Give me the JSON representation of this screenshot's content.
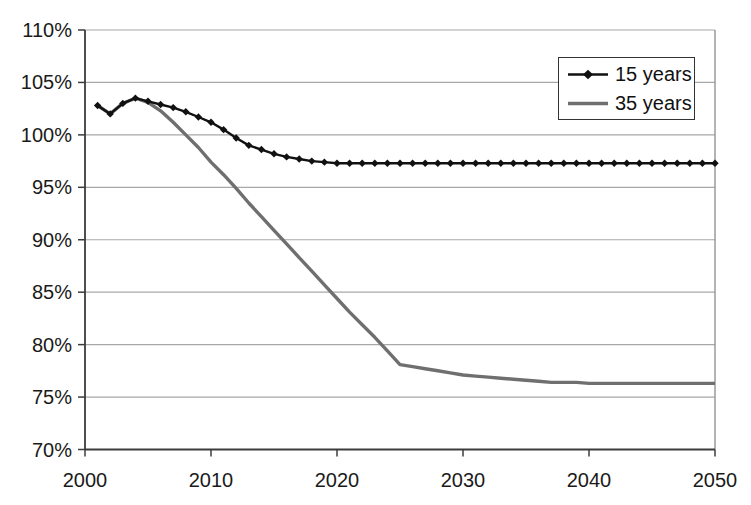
{
  "chart_data": {
    "type": "line",
    "title": "",
    "xlabel": "",
    "ylabel": "",
    "xlim": [
      2000,
      2050
    ],
    "ylim": [
      70,
      110
    ],
    "grid": "horizontal",
    "legend_position": "top-right",
    "x_tick_labels": [
      "2000",
      "2010",
      "2020",
      "2030",
      "2040",
      "2050"
    ],
    "x_tick_values": [
      2000,
      2010,
      2020,
      2030,
      2040,
      2050
    ],
    "y_tick_labels": [
      "110%",
      "105%",
      "100%",
      "95%",
      "90%",
      "85%",
      "80%",
      "75%",
      "70%"
    ],
    "y_tick_values": [
      110,
      105,
      100,
      95,
      90,
      85,
      80,
      75,
      70
    ],
    "colors": {
      "background": "#ffffff",
      "gridline": "#a8a8a8",
      "axis": "#3c3c3c",
      "plot_border": "#8c8c8c",
      "series_15_years": "#111111",
      "series_35_years": "#6f6f6f"
    },
    "x": [
      2001,
      2002,
      2003,
      2004,
      2005,
      2006,
      2007,
      2008,
      2009,
      2010,
      2011,
      2012,
      2013,
      2014,
      2015,
      2016,
      2017,
      2018,
      2019,
      2020,
      2021,
      2022,
      2023,
      2024,
      2025,
      2026,
      2027,
      2028,
      2029,
      2030,
      2031,
      2032,
      2033,
      2034,
      2035,
      2036,
      2037,
      2038,
      2039,
      2040,
      2041,
      2042,
      2043,
      2044,
      2045,
      2046,
      2047,
      2048,
      2049,
      2050
    ],
    "series": [
      {
        "name": "15 years",
        "color": "#111111",
        "marker": "diamond",
        "line_width": 2.4,
        "values": [
          102.8,
          102.0,
          103.0,
          103.5,
          103.2,
          102.9,
          102.6,
          102.2,
          101.7,
          101.2,
          100.5,
          99.7,
          99.0,
          98.6,
          98.2,
          97.9,
          97.7,
          97.5,
          97.4,
          97.3,
          97.3,
          97.3,
          97.3,
          97.3,
          97.3,
          97.3,
          97.3,
          97.3,
          97.3,
          97.3,
          97.3,
          97.3,
          97.3,
          97.3,
          97.3,
          97.3,
          97.3,
          97.3,
          97.3,
          97.3,
          97.3,
          97.3,
          97.3,
          97.3,
          97.3,
          97.3,
          97.3,
          97.3,
          97.3,
          97.3
        ]
      },
      {
        "name": "35 years",
        "color": "#6f6f6f",
        "marker": "none",
        "line_width": 3.4,
        "values": [
          102.8,
          102.0,
          103.0,
          103.5,
          103.1,
          102.3,
          101.2,
          100.0,
          98.8,
          97.4,
          96.2,
          94.9,
          93.5,
          92.2,
          90.9,
          89.6,
          88.3,
          87.0,
          85.7,
          84.4,
          83.1,
          81.9,
          80.7,
          79.4,
          78.1,
          77.9,
          77.7,
          77.5,
          77.3,
          77.1,
          77.0,
          76.9,
          76.8,
          76.7,
          76.6,
          76.5,
          76.4,
          76.4,
          76.4,
          76.3,
          76.3,
          76.3,
          76.3,
          76.3,
          76.3,
          76.3,
          76.3,
          76.3,
          76.3,
          76.3
        ]
      }
    ]
  }
}
